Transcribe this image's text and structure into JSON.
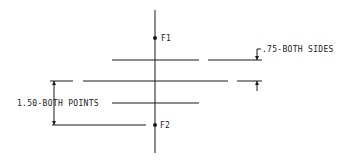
{
  "diagram": {
    "type": "technical-drawing",
    "colors": {
      "line": "#1a1a1a",
      "text": "#222222",
      "background": "#ffffff"
    },
    "points": [
      {
        "id": "F1",
        "label": "F1",
        "x": 155,
        "y": 38
      },
      {
        "id": "F2",
        "label": "F2",
        "x": 155,
        "y": 125
      }
    ],
    "annotations": {
      "sides": ".75-BOTH SIDES",
      "points": "1.50-BOTH POINTS"
    }
  }
}
